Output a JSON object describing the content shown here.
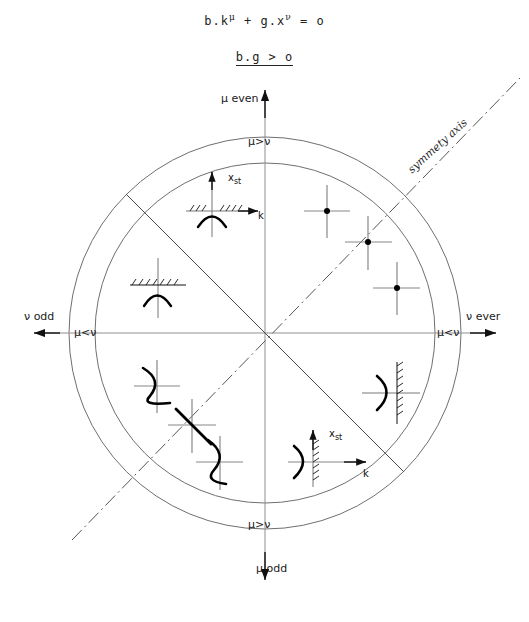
{
  "figure": {
    "equation": {
      "base": "b.k",
      "exp1": "μ",
      "operator": " + g.x",
      "exp2": "ν",
      "result": " = o"
    },
    "condition": "b.g > o",
    "axes": {
      "top": {
        "label": "μ even",
        "arrow": "up-arrow-icon"
      },
      "bottom": {
        "label": "μ odd",
        "arrow": "down-arrow-icon"
      },
      "left": {
        "label": "ν odd",
        "arrow": "left-arrow-icon"
      },
      "right": {
        "label": "ν ever",
        "arrow": "right-arrow-icon"
      }
    },
    "ring_labels": {
      "top": "μ>ν",
      "bottom": "μ>ν",
      "left": "μ<ν",
      "right": "μ<ν"
    },
    "symmetry_axis": "symmety axis",
    "geometry": {
      "center_x": 265,
      "center_y": 333,
      "inner_radius": 170,
      "outer_radius": 196,
      "sectors": 8
    },
    "insets": {
      "upper_left_parabola": {
        "vertical_axis": "x",
        "vertical_axis_sub": "st",
        "horizontal_axis": "k"
      },
      "lower_right_parabola": {
        "vertical_axis": "x",
        "vertical_axis_sub": "st",
        "horizontal_axis": "k"
      }
    },
    "colors": {
      "ink": "#1a1a1a",
      "circle_stroke": "#6b6b6b",
      "axis_stroke": "#8a8a8a",
      "curve_stroke": "#000000",
      "marker_fill": "#000000"
    }
  }
}
